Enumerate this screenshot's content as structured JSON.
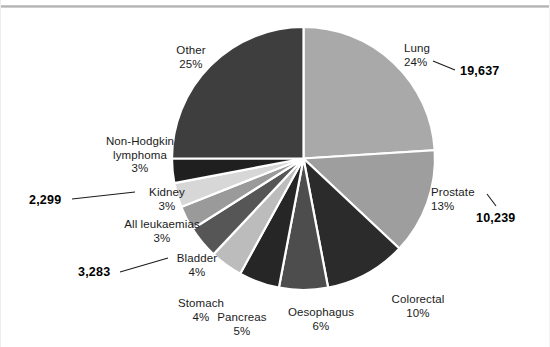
{
  "figure": {
    "background_color": "#ffffff",
    "rule_color": "#b4b4b4"
  },
  "chart_data": {
    "type": "pie",
    "title": "",
    "subtitle": "",
    "xlabel": "",
    "ylabel": "",
    "grid": false,
    "legend_position": "none",
    "label_format": "name + percent, selected slices annotated with absolute counts",
    "start_angle_deg": 0,
    "direction": "clockwise",
    "categories": [
      "Lung",
      "Prostate",
      "Colorectal",
      "Oesophagus",
      "Pancreas",
      "Stomach",
      "Bladder",
      "All leukaemias",
      "Kidney",
      "Non-Hodgkin lymphoma",
      "Other"
    ],
    "values": [
      24,
      13,
      10,
      6,
      5,
      4,
      4,
      3,
      3,
      3,
      25
    ],
    "slices": [
      {
        "name": "Lung",
        "percent": "24%",
        "value": 24,
        "color": "#a9a9a9",
        "count_label": "19,637"
      },
      {
        "name": "Prostate",
        "percent": "13%",
        "value": 13,
        "color": "#9e9e9e",
        "count_label": "10,239"
      },
      {
        "name": "Colorectal",
        "percent": "10%",
        "value": 10,
        "color": "#2b2b2b",
        "count_label": ""
      },
      {
        "name": "Oesophagus",
        "percent": "6%",
        "value": 6,
        "color": "#4d4d4d",
        "count_label": ""
      },
      {
        "name": "Pancreas",
        "percent": "5%",
        "value": 5,
        "color": "#262626",
        "count_label": ""
      },
      {
        "name": "Stomach",
        "percent": "4%",
        "value": 4,
        "color": "#bcbcbc",
        "count_label": ""
      },
      {
        "name": "Bladder",
        "percent": "4%",
        "value": 4,
        "color": "#565656",
        "count_label": "3,283"
      },
      {
        "name": "All leukaemias",
        "percent": "3%",
        "value": 3,
        "color": "#9a9a9a",
        "count_label": ""
      },
      {
        "name": "Kidney",
        "percent": "3%",
        "value": 3,
        "color": "#d7d7d7",
        "count_label": "2,299"
      },
      {
        "name": "Non-Hodgkin lymphoma",
        "percent": "3%",
        "value": 3,
        "color": "#1f1f1f",
        "count_label": ""
      },
      {
        "name": "Other",
        "percent": "25%",
        "value": 25,
        "color": "#3e3e3e",
        "count_label": ""
      }
    ],
    "annotations": [
      {
        "name": "Lung",
        "count": "19,637"
      },
      {
        "name": "Prostate",
        "count": "10,239"
      },
      {
        "name": "Bladder",
        "count": "3,283"
      },
      {
        "name": "Kidney",
        "count": "2,299"
      }
    ]
  },
  "labels": {
    "lung": {
      "name": "Lung",
      "percent": "24%"
    },
    "prostate": {
      "name": "Prostate",
      "percent": "13%"
    },
    "colorectal": {
      "name": "Colorectal",
      "percent": "10%"
    },
    "oesophagus": {
      "name": "Oesophagus",
      "percent": "6%"
    },
    "pancreas": {
      "name": "Pancreas",
      "percent": "5%"
    },
    "stomach": {
      "name": "Stomach",
      "percent": "4%"
    },
    "bladder": {
      "name": "Bladder",
      "percent": "4%"
    },
    "leukaemias": {
      "name": "All leukaemias",
      "percent": "3%"
    },
    "kidney": {
      "name": "Kidney",
      "percent": "3%"
    },
    "nhl": {
      "name_line1": "Non-Hodgkin",
      "name_line2": "lymphoma",
      "percent": "3%"
    },
    "other": {
      "name": "Other",
      "percent": "25%"
    }
  },
  "values": {
    "lung": "19,637",
    "prostate": "10,239",
    "bladder": "3,283",
    "kidney": "2,299"
  }
}
